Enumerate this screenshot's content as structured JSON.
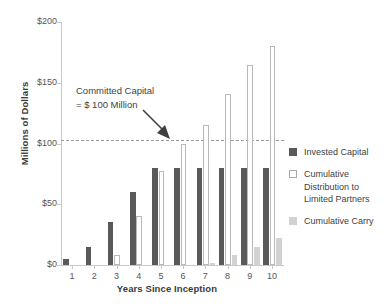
{
  "chart_data": {
    "type": "bar",
    "title": "",
    "xlabel": "Years Since Inception",
    "ylabel": "Millions of Dollars",
    "categories": [
      "1",
      "2",
      "3",
      "4",
      "5",
      "6",
      "7",
      "8",
      "9",
      "10"
    ],
    "ylim": [
      0,
      200
    ],
    "yticks": [
      0,
      50,
      100,
      150,
      200
    ],
    "ytick_labels": [
      "$0",
      "$50",
      "$100",
      "$150",
      "$200"
    ],
    "grid": false,
    "legend_position": "right",
    "series": [
      {
        "name": "Invested Capital",
        "color": "#595959",
        "values": [
          5,
          15,
          35,
          60,
          80,
          80,
          80,
          80,
          80,
          80
        ]
      },
      {
        "name": "Cumulative Distribution to Limited Partners",
        "color": "#ffffff",
        "values": [
          0,
          0,
          8,
          40,
          77,
          100,
          115,
          141,
          165,
          180
        ]
      },
      {
        "name": "Cumulative Carry",
        "color": "#d2d2d2",
        "values": [
          0,
          0,
          0,
          0,
          0,
          0,
          2,
          8,
          15,
          22
        ]
      }
    ],
    "annotations": [
      {
        "line1": "Committed Capital",
        "line2": "= $ 100 Million",
        "value": 100
      }
    ],
    "reference_line": {
      "value": 100,
      "style": "dashed",
      "color": "#9b9b9b"
    }
  },
  "legend": {
    "items": [
      {
        "label": "Invested Capital"
      },
      {
        "label": "Cumulative Distribution to Limited Partners"
      },
      {
        "label": "Cumulative Carry"
      }
    ]
  }
}
